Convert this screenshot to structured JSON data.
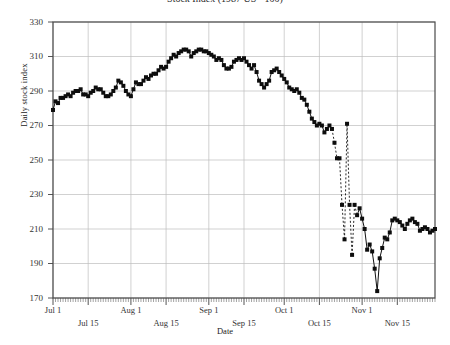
{
  "chart_data": {
    "type": "line",
    "title": "Stock Index (1987 US - 100)",
    "xlabel": "Date",
    "ylabel": "Daily stock index",
    "ylim": [
      170,
      330
    ],
    "yticks": [
      170,
      190,
      210,
      230,
      250,
      270,
      290,
      310,
      330
    ],
    "xticks": [
      "Jul 1",
      "Jul 15",
      "Aug 1",
      "Aug 15",
      "Sep 1",
      "Sep 15",
      "Oct 1",
      "Oct 15",
      "Nov 1",
      "Nov 15"
    ],
    "xtick_rows": [
      0,
      1,
      0,
      1,
      0,
      1,
      0,
      1,
      0,
      1
    ],
    "grid": true,
    "legend": "none",
    "marker": "filled-square",
    "x_start_label": "Jul 1",
    "x_end_label": "Nov 30",
    "series": [
      {
        "name": "Daily stock index",
        "x": [
          0,
          1,
          2,
          3,
          4,
          5,
          6,
          7,
          8,
          9,
          10,
          11,
          12,
          13,
          14,
          15,
          16,
          17,
          18,
          19,
          20,
          21,
          22,
          23,
          24,
          25,
          26,
          27,
          28,
          29,
          30,
          31,
          32,
          33,
          34,
          35,
          36,
          37,
          38,
          39,
          40,
          41,
          42,
          43,
          44,
          45,
          46,
          47,
          48,
          49,
          50,
          51,
          52,
          53,
          54,
          55,
          56,
          57,
          58,
          59,
          60,
          61,
          62,
          63,
          64,
          65,
          66,
          67,
          68,
          69,
          70,
          71,
          72,
          73,
          74,
          75,
          76,
          77,
          78,
          79,
          80,
          81,
          82,
          83,
          84,
          85,
          86,
          87,
          88,
          89,
          90,
          91,
          92,
          93,
          94,
          95,
          96,
          97,
          98,
          99,
          100,
          101,
          102,
          103,
          104,
          105,
          106,
          107,
          108,
          109,
          110,
          111,
          112,
          113,
          114,
          115,
          116,
          117,
          118,
          119,
          120,
          121,
          122,
          123,
          124,
          125,
          126,
          127,
          128,
          129,
          130,
          131,
          132,
          133,
          134,
          135,
          136,
          137,
          138,
          139,
          140,
          141,
          142,
          143,
          144,
          145,
          146,
          147,
          148,
          149,
          150,
          151,
          152
        ],
        "values": [
          279,
          284,
          283,
          286,
          286,
          287,
          288,
          287,
          289,
          290,
          290,
          291,
          288,
          288,
          287,
          289,
          290,
          292,
          291,
          291,
          289,
          287,
          287,
          288,
          290,
          292,
          296,
          295,
          293,
          290,
          288,
          287,
          291,
          295,
          294,
          294,
          296,
          298,
          297,
          299,
          300,
          300,
          302,
          304,
          303,
          304,
          307,
          309,
          311,
          310,
          312,
          313,
          314,
          314,
          313,
          310,
          312,
          313,
          314,
          314,
          313,
          313,
          312,
          311,
          310,
          308,
          309,
          308,
          305,
          303,
          303,
          304,
          307,
          308,
          309,
          308,
          309,
          307,
          305,
          303,
          305,
          301,
          296,
          294,
          292,
          294,
          296,
          301,
          302,
          303,
          301,
          299,
          297,
          295,
          292,
          291,
          290,
          291,
          289,
          286,
          285,
          282,
          278,
          274,
          272,
          270,
          271,
          270,
          266,
          268,
          270,
          268,
          260,
          251,
          251,
          224,
          204,
          271,
          224,
          195,
          224,
          218,
          222,
          216,
          210,
          198,
          201,
          197,
          187,
          174,
          193,
          199,
          205,
          204,
          208,
          215,
          216,
          215,
          214,
          212,
          210,
          213,
          215,
          216,
          214,
          213,
          209,
          210,
          211,
          210,
          208,
          209,
          210
        ]
      }
    ],
    "dashed_segments": [
      {
        "from": 111,
        "to": 117
      },
      {
        "from": 117,
        "to": 120
      },
      {
        "from": 120,
        "to": 121
      }
    ]
  }
}
